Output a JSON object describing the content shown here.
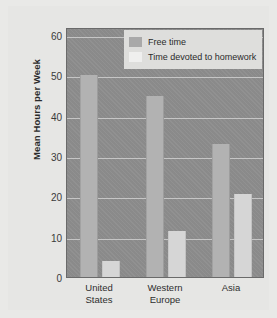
{
  "chart_data": {
    "type": "bar",
    "title": "",
    "xlabel": "",
    "ylabel": "Mean Hours per Week",
    "categories": [
      "United\nStates",
      "Western\nEurope",
      "Asia"
    ],
    "ylim": [
      0,
      62
    ],
    "yticks": [
      0,
      10,
      20,
      30,
      40,
      50,
      60
    ],
    "ytick_labels": [
      "0",
      "10",
      "20",
      "30",
      "40",
      "50",
      "60"
    ],
    "grid": true,
    "legend_position": "top-right",
    "series": [
      {
        "name": "Free time",
        "color": "#b2b2b2",
        "values": [
          50,
          45,
          33
        ]
      },
      {
        "name": "Time devoted to homework",
        "color": "#d6d6d6",
        "values": [
          4,
          11.5,
          20.5
        ]
      }
    ]
  },
  "legend": {
    "items": [
      {
        "label": "Free time",
        "swatch": "free"
      },
      {
        "label": "Time devoted to homework",
        "swatch": "homework"
      }
    ]
  },
  "colors": {
    "plot_background": "#8d8d8d",
    "figure_background": "#e6e6e4",
    "gridline": "#cfcfcf",
    "free_time_bar": "#b2b2b2",
    "homework_bar": "#d6d6d6",
    "axis_text": "#2e2e2e"
  }
}
